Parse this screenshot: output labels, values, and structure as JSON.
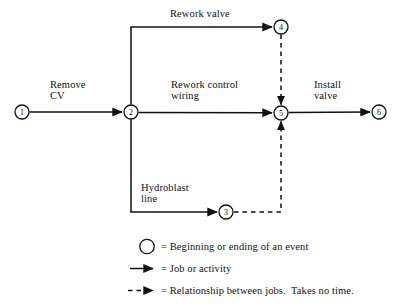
{
  "diagram": {
    "nodes": [
      {
        "id": "1",
        "label": "1",
        "cx": 22,
        "cy": 112,
        "r": 7
      },
      {
        "id": "2",
        "label": "2",
        "cx": 131,
        "cy": 112,
        "r": 7
      },
      {
        "id": "3",
        "label": "3",
        "cx": 226,
        "cy": 212,
        "r": 7
      },
      {
        "id": "4",
        "label": "4",
        "cx": 281,
        "cy": 27,
        "r": 7
      },
      {
        "id": "5",
        "label": "5",
        "cx": 281,
        "cy": 113,
        "r": 7
      },
      {
        "id": "6",
        "label": "6",
        "cx": 379,
        "cy": 112,
        "r": 7
      }
    ],
    "edges": [
      {
        "id": "remove-cv",
        "from": "1",
        "to": "2",
        "label": "Remove\nCV",
        "style": "solid"
      },
      {
        "id": "rework-valve",
        "from": "2",
        "to": "4",
        "label": "Rework valve",
        "style": "solid"
      },
      {
        "id": "rework-control-wiring",
        "from": "2",
        "to": "5",
        "label": "Rework control\nwiring",
        "style": "solid"
      },
      {
        "id": "hydroblast-line",
        "from": "2",
        "to": "3",
        "label": "Hydroblast\nline",
        "style": "solid"
      },
      {
        "id": "install-valve",
        "from": "5",
        "to": "6",
        "label": "Install\nvalve",
        "style": "solid"
      },
      {
        "id": "dummy-4-5",
        "from": "4",
        "to": "5",
        "label": "",
        "style": "dashed"
      },
      {
        "id": "dummy-3-5",
        "from": "3",
        "to": "5",
        "label": "",
        "style": "dashed"
      }
    ],
    "labels": {
      "remove_cv_line1": "Remove",
      "remove_cv_line2": "CV",
      "rework_valve": "Rework valve",
      "rework_control_line1": "Rework control",
      "rework_control_line2": "wiring",
      "hydroblast_line1": "Hydroblast",
      "hydroblast_line2": "line",
      "install_valve_line1": "Install",
      "install_valve_line2": "valve"
    },
    "colors": {
      "line": "#111111",
      "text": "#111111",
      "background": "#ffffff"
    }
  },
  "legend": {
    "items": [
      {
        "symbol": "circle",
        "text": "= Beginning or ending of an event"
      },
      {
        "symbol": "solid-arrow",
        "text": "= Job or activity"
      },
      {
        "symbol": "dashed-arrow",
        "text": "= Relationship between jobs.  Takes no time."
      }
    ]
  }
}
